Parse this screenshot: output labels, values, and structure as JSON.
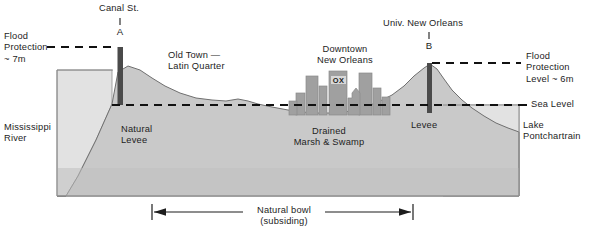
{
  "diagram": {
    "type": "cross-section-profile",
    "colors": {
      "water": "#e2e2e2",
      "land": "#c9c9c9",
      "subsurface": "#b6b6b6",
      "buildings": "#a0a0a0",
      "levee": "#4a4a4a",
      "outline": "#6a6a6a",
      "text": "#1d1d1d",
      "dash": "#111111"
    },
    "labels": {
      "flood_protection_left": "Flood\nProtection\n~ 7m",
      "canal_street": "Canal St.",
      "canal_street_marker": "A",
      "old_town": "Old Town —\nLatin Quarter",
      "downtown": "Downtown\nNew Orleans",
      "building_sign": "OX",
      "univ_new_orleans": "Univ. New Orleans",
      "univ_new_orleans_marker": "B",
      "flood_protection_right": "Flood\nProtection\nLevel ~ 6m",
      "sea_level": "Sea Level",
      "mississippi_river": "Mississippi\nRiver",
      "natural_levee": "Natural\nLevee",
      "drained_marsh": "Drained\nMarsh & Swamp",
      "levee_right": "Levee",
      "lake_pontchartrain": "Lake\nPontchartrain",
      "natural_bowl": "Natural bowl",
      "natural_bowl_sub": "(subsiding)"
    },
    "elevations": {
      "flood_protection_left_m": 7,
      "flood_protection_right_m": 6,
      "sea_level_m": 0
    }
  }
}
